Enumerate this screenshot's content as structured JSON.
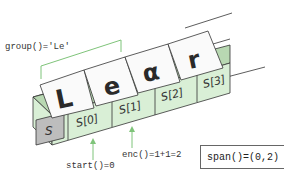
{
  "diagram": {
    "group_label": "group()='Le'",
    "start_label": "start()=0",
    "end_label": "enc()=1+1=2",
    "span_label": "span()=(0,2)",
    "string_box_label": "S",
    "cells": [
      {
        "label": "S[0]",
        "letter": "L"
      },
      {
        "label": "S[1]",
        "letter": "e"
      },
      {
        "label": "S[2]",
        "letter": "α"
      },
      {
        "label": "S[3]",
        "letter": "r"
      }
    ],
    "colors": {
      "cell_fill": "#d9efd6",
      "cell_top": "#b8d8b2",
      "string_box": "#bdbdbd",
      "arrow": "#7fc47a",
      "bracket": "#7fc47a",
      "outline": "#333333"
    }
  }
}
